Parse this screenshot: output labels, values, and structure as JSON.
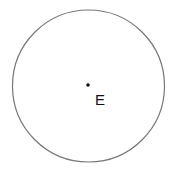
{
  "diagram": {
    "circle": {
      "cx": 88.5,
      "cy": 86,
      "r": 76,
      "stroke": "#777777"
    },
    "center_point": {
      "cx": 88,
      "cy": 85,
      "r": 1.8,
      "fill": "#111111"
    },
    "label": {
      "text": "E",
      "x": 95,
      "y": 105
    }
  }
}
